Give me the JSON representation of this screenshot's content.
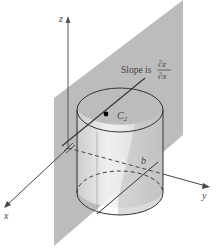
{
  "figure": {
    "axes": {
      "x_label": "x",
      "y_label": "y",
      "z_label": "z"
    },
    "labels": {
      "slope_prefix": "Slope is",
      "slope_numerator": "∂z",
      "slope_denominator": "∂x",
      "curve_name": "C",
      "curve_subscript": "2",
      "plane_intercept": "b"
    },
    "colors": {
      "plane_fill": "#b8b8b8",
      "cylinder_fill": "#d2d2d2",
      "cylinder_highlight": "#f2f2f2",
      "line": "#333333",
      "axis": "#555555",
      "point": "#000000",
      "background": "#ffffff"
    }
  }
}
